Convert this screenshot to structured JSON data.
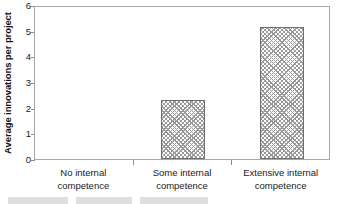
{
  "chart_data": {
    "type": "bar",
    "title": "",
    "xlabel": "",
    "ylabel": "Average innovations per project",
    "categories": [
      "No internal competence",
      "Some internal competence",
      "Extensive internal competence"
    ],
    "category_lines": [
      [
        "No internal",
        "competence"
      ],
      [
        "Some internal",
        "competence"
      ],
      [
        "Extensive internal",
        "competence"
      ]
    ],
    "values": [
      0,
      2.3,
      5.15
    ],
    "ylim": [
      0,
      6
    ],
    "yticks": [
      0,
      1,
      2,
      3,
      4,
      5,
      6
    ],
    "ytick_labels": [
      "0",
      "1",
      "2",
      "3",
      "4",
      "5",
      "6"
    ],
    "grid": false,
    "legend": false,
    "bar_fill": "#ffffff",
    "bar_hatch_color": "#9a9a9a",
    "bar_edge_color": "#6f6f6f",
    "axis_color": "#a8a8a8",
    "text_color": "#1a1a1a"
  }
}
